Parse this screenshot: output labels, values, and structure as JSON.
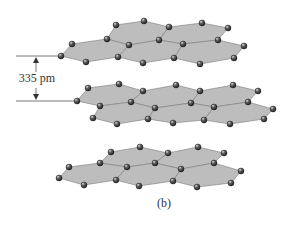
{
  "figure": {
    "caption": "(b)",
    "spacing_label": "335 pm",
    "colors": {
      "sheet_fill": "#bdbdbd",
      "sheet_edge": "#7a7a7a",
      "atom": "#2a2a2a",
      "atom_highlight": "#d8d8d8",
      "dim_line": "#555555"
    },
    "layers": [
      {
        "name": "top",
        "hexagons": [
          [
            [
              116,
              25
            ],
            [
              144,
              21
            ],
            [
              169,
              27
            ],
            [
              159,
              40
            ],
            [
              129,
              45
            ],
            [
              107,
              39
            ]
          ],
          [
            [
              169,
              27
            ],
            [
              202,
              23
            ],
            [
              228,
              28
            ],
            [
              218,
              40
            ],
            [
              183,
              44
            ],
            [
              159,
              40
            ]
          ],
          [
            [
              72,
              44
            ],
            [
              107,
              39
            ],
            [
              129,
              45
            ],
            [
              118,
              57
            ],
            [
              86,
              62
            ],
            [
              61,
              56
            ]
          ],
          [
            [
              129,
              45
            ],
            [
              159,
              40
            ],
            [
              183,
              44
            ],
            [
              174,
              58
            ],
            [
              143,
              63
            ],
            [
              118,
              57
            ]
          ],
          [
            [
              183,
              44
            ],
            [
              218,
              40
            ],
            [
              244,
              46
            ],
            [
              234,
              58
            ],
            [
              200,
              64
            ],
            [
              174,
              58
            ]
          ]
        ],
        "atoms": [
          [
            116,
            25
          ],
          [
            144,
            21
          ],
          [
            169,
            27
          ],
          [
            202,
            23
          ],
          [
            228,
            28
          ],
          [
            72,
            44
          ],
          [
            107,
            39
          ],
          [
            129,
            45
          ],
          [
            159,
            40
          ],
          [
            183,
            44
          ],
          [
            218,
            40
          ],
          [
            244,
            46
          ],
          [
            61,
            56
          ],
          [
            86,
            62
          ],
          [
            118,
            57
          ],
          [
            143,
            63
          ],
          [
            174,
            58
          ],
          [
            200,
            64
          ],
          [
            234,
            58
          ]
        ]
      },
      {
        "name": "middle",
        "hexagons": [
          [
            [
              88,
              88
            ],
            [
              119,
              84
            ],
            [
              143,
              91
            ],
            [
              131,
              102
            ],
            [
              100,
              106
            ],
            [
              77,
              101
            ]
          ],
          [
            [
              143,
              91
            ],
            [
              176,
              85
            ],
            [
              200,
              91
            ],
            [
              191,
              103
            ],
            [
              155,
              108
            ],
            [
              131,
              102
            ]
          ],
          [
            [
              200,
              91
            ],
            [
              233,
              85
            ],
            [
              258,
              91
            ],
            [
              248,
              102
            ],
            [
              214,
              107
            ],
            [
              191,
              103
            ]
          ],
          [
            [
              100,
              106
            ],
            [
              131,
              102
            ],
            [
              155,
              108
            ],
            [
              148,
              119
            ],
            [
              117,
              124
            ],
            [
              93,
              118
            ]
          ],
          [
            [
              155,
              108
            ],
            [
              191,
              103
            ],
            [
              214,
              107
            ],
            [
              204,
              120
            ],
            [
              173,
              123
            ],
            [
              148,
              119
            ]
          ],
          [
            [
              214,
              107
            ],
            [
              248,
              102
            ],
            [
              273,
              109
            ],
            [
              264,
              119
            ],
            [
              230,
              124
            ],
            [
              204,
              120
            ]
          ]
        ],
        "atoms": [
          [
            88,
            88
          ],
          [
            119,
            84
          ],
          [
            143,
            91
          ],
          [
            176,
            85
          ],
          [
            200,
            91
          ],
          [
            233,
            85
          ],
          [
            258,
            91
          ],
          [
            77,
            101
          ],
          [
            100,
            106
          ],
          [
            131,
            102
          ],
          [
            155,
            108
          ],
          [
            191,
            103
          ],
          [
            214,
            107
          ],
          [
            248,
            102
          ],
          [
            273,
            109
          ],
          [
            93,
            118
          ],
          [
            117,
            124
          ],
          [
            148,
            119
          ],
          [
            173,
            123
          ],
          [
            204,
            120
          ],
          [
            230,
            124
          ],
          [
            264,
            119
          ]
        ]
      },
      {
        "name": "bottom",
        "hexagons": [
          [
            [
              111,
              152
            ],
            [
              140,
              147
            ],
            [
              168,
              153
            ],
            [
              155,
              163
            ],
            [
              127,
              167
            ],
            [
              100,
              163
            ]
          ],
          [
            [
              168,
              153
            ],
            [
              198,
              147
            ],
            [
              224,
              153
            ],
            [
              214,
              163
            ],
            [
              181,
              169
            ],
            [
              155,
              163
            ]
          ],
          [
            [
              69,
              167
            ],
            [
              100,
              163
            ],
            [
              127,
              167
            ],
            [
              116,
              180
            ],
            [
              84,
              185
            ],
            [
              59,
              178
            ]
          ],
          [
            [
              127,
              167
            ],
            [
              155,
              163
            ],
            [
              181,
              169
            ],
            [
              173,
              181
            ],
            [
              139,
              186
            ],
            [
              116,
              180
            ]
          ],
          [
            [
              181,
              169
            ],
            [
              214,
              163
            ],
            [
              241,
              171
            ],
            [
              231,
              183
            ],
            [
              197,
              187
            ],
            [
              173,
              181
            ]
          ]
        ],
        "atoms": [
          [
            111,
            152
          ],
          [
            140,
            147
          ],
          [
            168,
            153
          ],
          [
            198,
            147
          ],
          [
            224,
            153
          ],
          [
            69,
            167
          ],
          [
            100,
            163
          ],
          [
            127,
            167
          ],
          [
            155,
            163
          ],
          [
            181,
            169
          ],
          [
            214,
            163
          ],
          [
            241,
            171
          ],
          [
            59,
            178
          ],
          [
            84,
            185
          ],
          [
            116,
            180
          ],
          [
            139,
            186
          ],
          [
            173,
            181
          ],
          [
            197,
            187
          ],
          [
            231,
            183
          ]
        ]
      }
    ],
    "dimension": {
      "top_line": {
        "x1": 16,
        "x2": 58,
        "y": 56
      },
      "bottom_line": {
        "x1": 16,
        "x2": 74,
        "y": 101
      },
      "arrow_x": 36,
      "label_pos": {
        "x": 37,
        "y": 82
      }
    },
    "caption_pos": {
      "x": 164,
      "y": 207
    }
  }
}
